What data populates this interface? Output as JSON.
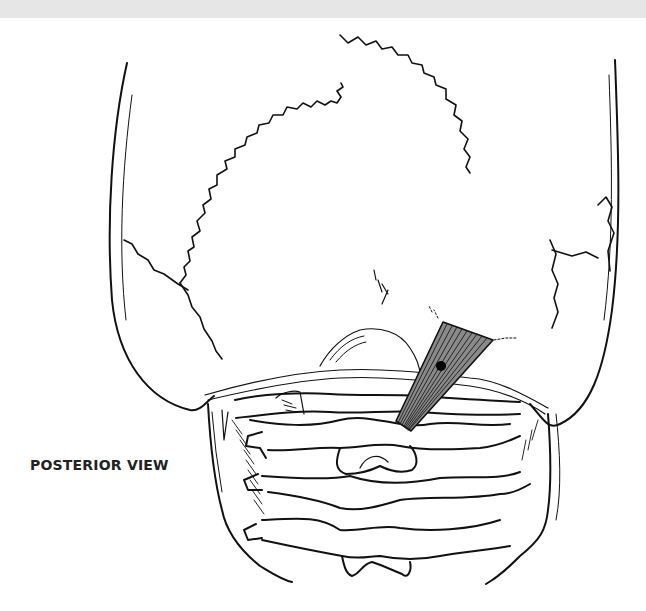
{
  "figure": {
    "label": "POSTERIOR VIEW",
    "highlight": {
      "structure": "muscle",
      "fill_color": "#8a8a8a",
      "stripe_color": "#1a1a1a",
      "marker": "trigger-point-dot",
      "marker_color": "#000000"
    },
    "line_color": "#111111",
    "background": "#ffffff",
    "top_strip_color": "#e6e6e6"
  }
}
